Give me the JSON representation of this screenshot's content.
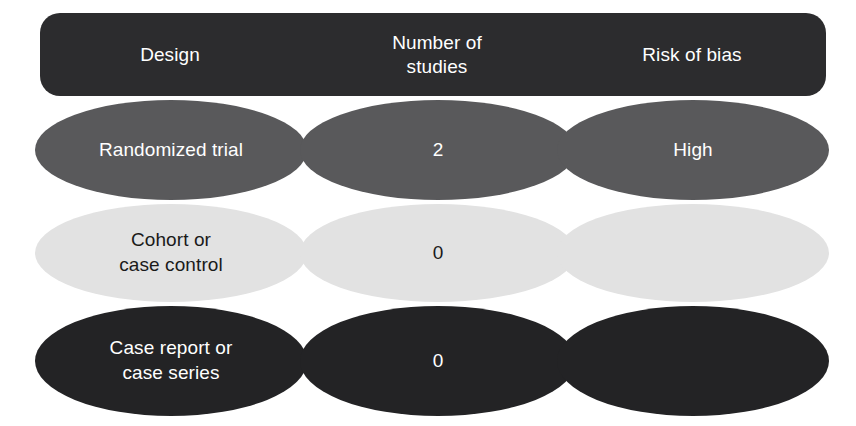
{
  "table": {
    "headers": [
      {
        "id": "design",
        "label": "Design"
      },
      {
        "id": "num-studies",
        "label": "Number of\nstudies"
      },
      {
        "id": "risk-of-bias",
        "label": "Risk of bias"
      }
    ],
    "rows": [
      {
        "id": "randomized-trial",
        "tone": "mid",
        "design": "Randomized trial",
        "number_of_studies": "2",
        "risk_of_bias": "High"
      },
      {
        "id": "cohort-or-case-control",
        "tone": "light",
        "design": "Cohort or\ncase control",
        "number_of_studies": "0",
        "risk_of_bias": ""
      },
      {
        "id": "case-report-or-case-series",
        "tone": "dark",
        "design": "Case report or\ncase series",
        "number_of_studies": "0",
        "risk_of_bias": ""
      }
    ]
  },
  "colors": {
    "header_fill": "#2c2c2e",
    "row_mid_fill": "#59595b",
    "row_light_fill": "#e2e2e2",
    "row_dark_fill": "#232325",
    "light_text": "#ffffff",
    "dark_text": "#1a1a1a",
    "background": "#ffffff"
  }
}
